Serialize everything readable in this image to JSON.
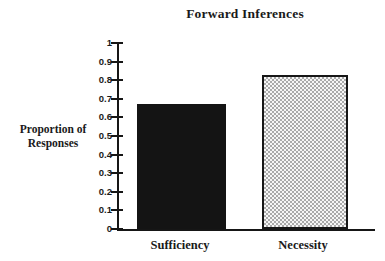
{
  "chart_data": {
    "type": "bar",
    "title": "Forward Inferences",
    "categories": [
      "Sufficiency",
      "Necessity"
    ],
    "values": [
      0.67,
      0.83
    ],
    "ylabel": "Proportion of Responses",
    "ylabel_lines": [
      "Proportion of",
      "Responses"
    ],
    "xlabel": "",
    "ylim": [
      0,
      1
    ],
    "ytick_labels": [
      "1",
      "0.9",
      "0.8",
      "0.7",
      "0.6",
      "0.5",
      "0.4",
      "0.3",
      "0.2",
      "0.1",
      "0"
    ],
    "grid": false,
    "legend": false,
    "bar_fills": [
      "solid-black",
      "dot-screen-pattern"
    ],
    "colors": {
      "bar_solid": "#141414",
      "pattern_fg": "#aaaaaa",
      "pattern_bg": "#f6f6f6",
      "axis": "#161616",
      "background": "#ffffff",
      "text": "#1a1a1a"
    }
  }
}
